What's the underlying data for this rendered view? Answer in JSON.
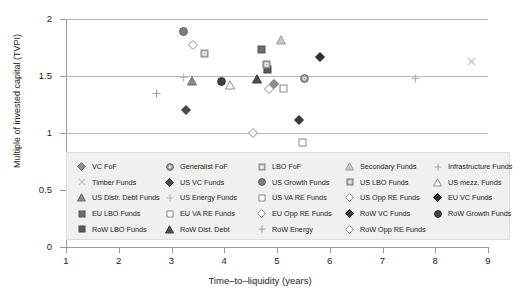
{
  "chart_data": {
    "type": "scatter",
    "title": "",
    "xlabel": "Time‒to‒liquidity (years)",
    "ylabel": "Multiple of invested capital (TVPI)",
    "xlim": [
      1,
      9
    ],
    "ylim": [
      0,
      2
    ],
    "xticks": [
      "1",
      "2",
      "3",
      "4",
      "5",
      "6",
      "7",
      "8",
      "9"
    ],
    "yticks": [
      "0",
      "0.5",
      "1",
      "1.5",
      "2"
    ],
    "grid": true,
    "grid_axis": "y",
    "legend_position": "below-plot",
    "points": [
      {
        "series": "VC FoF",
        "x": 4.95,
        "y": 1.43
      },
      {
        "series": "Timber Funds",
        "x": 8.68,
        "y": 1.63
      },
      {
        "series": "US Distr. Debt Funds",
        "x": 3.38,
        "y": 1.46
      },
      {
        "series": "EU LBO Funds",
        "x": 4.7,
        "y": 1.73
      },
      {
        "series": "RoW LBO Funds",
        "x": 4.82,
        "y": 1.56
      },
      {
        "series": "Generalist FoF",
        "x": 5.52,
        "y": 1.48
      },
      {
        "series": "US VC Funds",
        "x": 3.27,
        "y": 1.2
      },
      {
        "series": "US Energy Funds",
        "x": 3.23,
        "y": 1.49
      },
      {
        "series": "EU VA RE Funds",
        "x": 5.13,
        "y": 1.39
      },
      {
        "series": "RoW Dist. Debt",
        "x": 4.62,
        "y": 1.47
      },
      {
        "series": "LBO FoF",
        "x": 3.62,
        "y": 1.7
      },
      {
        "series": "US Growth Funds",
        "x": 3.22,
        "y": 1.89
      },
      {
        "series": "US VA RE Funds",
        "x": 5.48,
        "y": 0.92
      },
      {
        "series": "EU Opp RE Funds",
        "x": 4.85,
        "y": 1.39
      },
      {
        "series": "RoW Energy",
        "x": 2.72,
        "y": 1.35
      },
      {
        "series": "Secondary Funds",
        "x": 5.08,
        "y": 1.82
      },
      {
        "series": "US LBO Funds",
        "x": 4.8,
        "y": 1.6
      },
      {
        "series": "US Opp RE Funds",
        "x": 4.55,
        "y": 1.0
      },
      {
        "series": "RoW VC Funds",
        "x": 5.42,
        "y": 1.11
      },
      {
        "series": "RoW Opp RE Funds",
        "x": 3.4,
        "y": 1.77
      },
      {
        "series": "Infrastructure Funds",
        "x": 7.62,
        "y": 1.48
      },
      {
        "series": "US mezz. Funds",
        "x": 4.1,
        "y": 1.42
      },
      {
        "series": "EU VC Funds",
        "x": 5.82,
        "y": 1.67
      },
      {
        "series": "RoW Growth Funds",
        "x": 3.95,
        "y": 1.45
      }
    ]
  },
  "legend": {
    "items": [
      {
        "label": "VC FoF",
        "shape": "diamond",
        "fill": "#8e8e8e",
        "stroke": "#6e6e6e"
      },
      {
        "label": "Generalist FoF",
        "shape": "circle-ring",
        "fill": "#9b9b9b",
        "stroke": "#6a6a6a"
      },
      {
        "label": "LBO FoF",
        "shape": "square-ring",
        "fill": "#b5b5b5",
        "stroke": "#8a8a8a"
      },
      {
        "label": "Secondary Funds",
        "shape": "triangle-open",
        "fill": "#c9c9c9",
        "stroke": "#9a9a9a"
      },
      {
        "label": "Infrastructure Funds",
        "shape": "plus",
        "fill": "#b0b0b0",
        "stroke": "#b0b0b0"
      },
      {
        "label": "Timber Funds",
        "shape": "cross",
        "fill": "#c4c4c4",
        "stroke": "#c4c4c4"
      },
      {
        "label": "US VC Funds",
        "shape": "diamond",
        "fill": "#4a4a4a",
        "stroke": "#3a3a3a"
      },
      {
        "label": "US Growth Funds",
        "shape": "circle",
        "fill": "#7e7e7e",
        "stroke": "#5e5e5e"
      },
      {
        "label": "US LBO Funds",
        "shape": "square-ring",
        "fill": "#a8a8a8",
        "stroke": "#7d7d7d"
      },
      {
        "label": "US mezz. Funds",
        "shape": "triangle-open",
        "fill": "#ffffff",
        "stroke": "#8f8f8f"
      },
      {
        "label": "US Distr. Debt Funds",
        "shape": "triangle",
        "fill": "#8a8a8a",
        "stroke": "#6d6d6d"
      },
      {
        "label": "US Energy Funds",
        "shape": "plus",
        "fill": "#b8b8b8",
        "stroke": "#b8b8b8"
      },
      {
        "label": "US VA RE Funds",
        "shape": "square-open",
        "fill": "#ffffff",
        "stroke": "#8a8a8a"
      },
      {
        "label": "US Opp RE Funds",
        "shape": "diamond-open",
        "fill": "#ffffff",
        "stroke": "#8a8a8a"
      },
      {
        "label": "EU VC Funds",
        "shape": "diamond",
        "fill": "#2f2f2f",
        "stroke": "#222222"
      },
      {
        "label": "EU LBO Funds",
        "shape": "square",
        "fill": "#6e6e6e",
        "stroke": "#555555"
      },
      {
        "label": "EU VA RE Funds",
        "shape": "square-open",
        "fill": "#ffffff",
        "stroke": "#8a8a8a"
      },
      {
        "label": "EU Opp RE Funds",
        "shape": "diamond-open",
        "fill": "#ffffff",
        "stroke": "#8a8a8a"
      },
      {
        "label": "RoW VC Funds",
        "shape": "diamond",
        "fill": "#3a3a3a",
        "stroke": "#2a2a2a"
      },
      {
        "label": "RoW Growth Funds",
        "shape": "circle",
        "fill": "#3f3f3f",
        "stroke": "#2f2f2f"
      },
      {
        "label": "RoW LBO Funds",
        "shape": "square",
        "fill": "#5a5a5a",
        "stroke": "#444444"
      },
      {
        "label": "RoW Dist. Debt",
        "shape": "triangle",
        "fill": "#4d4d4d",
        "stroke": "#3a3a3a"
      },
      {
        "label": "RoW Energy",
        "shape": "plus",
        "fill": "#a0a0a0",
        "stroke": "#a0a0a0"
      },
      {
        "label": "RoW Opp RE Funds",
        "shape": "diamond-open",
        "fill": "#ffffff",
        "stroke": "#8a8a8a"
      }
    ]
  },
  "colors": {
    "axis": "#9a9a9a",
    "gridline": "#b9b9b9",
    "text": "#231f20",
    "legend_bg": "#f0f0f0",
    "legend_border": "#dcdcdc",
    "background": "#ffffff"
  }
}
